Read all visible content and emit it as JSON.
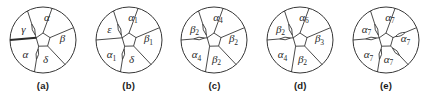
{
  "figure": {
    "background_color": "#ffffff",
    "stroke_color": "#2b2b2b",
    "label_color": "#2a2a2a",
    "panel_count": 5
  },
  "panels": [
    {
      "caption": "(a)",
      "regions": [
        {
          "id": "top",
          "label": "α",
          "sub": ""
        },
        {
          "id": "right",
          "label": "β",
          "sub": ""
        },
        {
          "id": "bottom",
          "label": "δ",
          "sub": ""
        },
        {
          "id": "lower-left",
          "label": "α",
          "sub": ""
        },
        {
          "id": "upper-left",
          "label": "γ",
          "sub": ""
        }
      ],
      "spokes": [
        {
          "id": "spoke-up",
          "decoration": "plain"
        },
        {
          "id": "spoke-upper-right",
          "decoration": "plain"
        },
        {
          "id": "spoke-lower-right",
          "decoration": "plain"
        },
        {
          "id": "spoke-lower-left",
          "decoration": "lens"
        },
        {
          "id": "spoke-left",
          "decoration": "bold"
        },
        {
          "id": "spoke-upper-left",
          "decoration": "lens"
        }
      ]
    },
    {
      "caption": "(b)",
      "regions": [
        {
          "id": "top",
          "label": "α",
          "sub": "1"
        },
        {
          "id": "right",
          "label": "β",
          "sub": "1"
        },
        {
          "id": "bottom",
          "label": "δ",
          "sub": ""
        },
        {
          "id": "lower-left",
          "label": "α",
          "sub": "1"
        },
        {
          "id": "upper-left",
          "label": "ε",
          "sub": ""
        }
      ],
      "spokes": [
        {
          "id": "spoke-up",
          "decoration": "plain"
        },
        {
          "id": "spoke-upper-right",
          "decoration": "plain"
        },
        {
          "id": "spoke-lower-right",
          "decoration": "plain"
        },
        {
          "id": "spoke-lower-left",
          "decoration": "lens"
        },
        {
          "id": "spoke-left",
          "decoration": "plain"
        },
        {
          "id": "spoke-upper-left",
          "decoration": "lens"
        }
      ]
    },
    {
      "caption": "(c)",
      "regions": [
        {
          "id": "top",
          "label": "α",
          "sub": "4"
        },
        {
          "id": "right",
          "label": "β",
          "sub": "2"
        },
        {
          "id": "bottom",
          "label": "β",
          "sub": "2"
        },
        {
          "id": "lower-left",
          "label": "α",
          "sub": "4"
        },
        {
          "id": "upper-left",
          "label": "β",
          "sub": "2"
        }
      ],
      "spokes": [
        {
          "id": "spoke-up",
          "decoration": "plain"
        },
        {
          "id": "spoke-upper-right",
          "decoration": "plain"
        },
        {
          "id": "spoke-lower-right",
          "decoration": "plain"
        },
        {
          "id": "spoke-lower-left",
          "decoration": "plain"
        },
        {
          "id": "spoke-left",
          "decoration": "lens"
        },
        {
          "id": "spoke-upper-left",
          "decoration": "lens"
        }
      ]
    },
    {
      "caption": "(d)",
      "regions": [
        {
          "id": "top",
          "label": "α",
          "sub": "6"
        },
        {
          "id": "right",
          "label": "β",
          "sub": "3"
        },
        {
          "id": "bottom",
          "label": "β",
          "sub": "2"
        },
        {
          "id": "lower-left",
          "label": "α",
          "sub": "4"
        },
        {
          "id": "upper-left",
          "label": "β",
          "sub": "2"
        }
      ],
      "spokes": [
        {
          "id": "spoke-up",
          "decoration": "plain"
        },
        {
          "id": "spoke-upper-right",
          "decoration": "plain"
        },
        {
          "id": "spoke-lower-right",
          "decoration": "plain"
        },
        {
          "id": "spoke-lower-left",
          "decoration": "plain"
        },
        {
          "id": "spoke-left",
          "decoration": "lens"
        },
        {
          "id": "spoke-upper-left",
          "decoration": "lens"
        }
      ]
    },
    {
      "caption": "(e)",
      "regions": [
        {
          "id": "top",
          "label": "α",
          "sub": "7"
        },
        {
          "id": "right",
          "label": "α",
          "sub": "7"
        },
        {
          "id": "bottom",
          "label": "α",
          "sub": "7"
        },
        {
          "id": "lower-left",
          "label": "α",
          "sub": "7"
        },
        {
          "id": "upper-left",
          "label": "α",
          "sub": "7"
        }
      ],
      "spokes": [
        {
          "id": "spoke-up",
          "decoration": "plain"
        },
        {
          "id": "spoke-upper-right",
          "decoration": "lens"
        },
        {
          "id": "spoke-lower-right",
          "decoration": "lens"
        },
        {
          "id": "spoke-lower-left",
          "decoration": "lens"
        },
        {
          "id": "spoke-left",
          "decoration": "lens"
        },
        {
          "id": "spoke-upper-left",
          "decoration": "lens"
        }
      ]
    }
  ]
}
